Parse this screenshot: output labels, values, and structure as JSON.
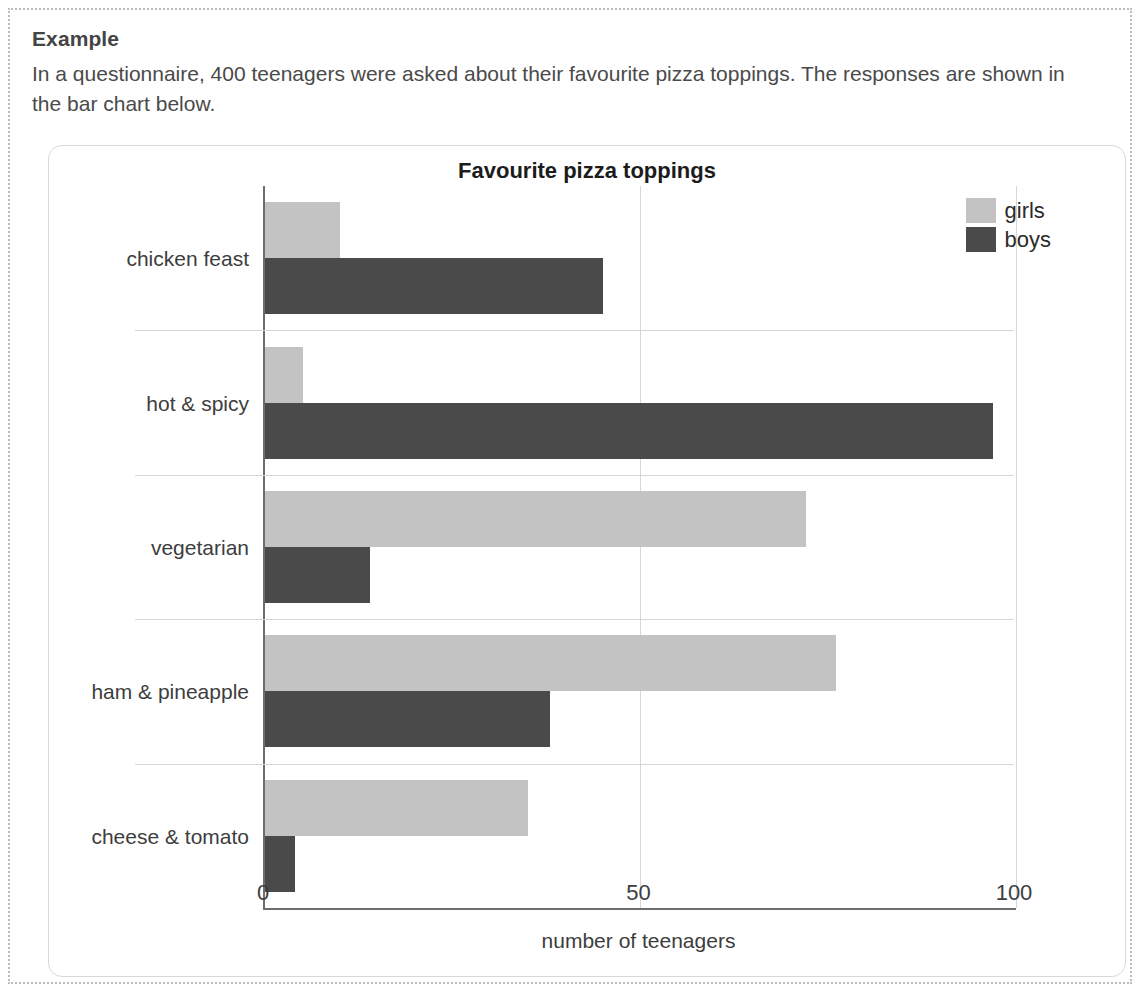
{
  "example": {
    "heading": "Example",
    "body": "In a questionnaire, 400 teenagers were asked about their favourite pizza toppings. The responses are shown in the bar chart below."
  },
  "chart_data": {
    "type": "bar",
    "orientation": "horizontal",
    "title": "Favourite pizza toppings",
    "xlabel": "number of teenagers",
    "ylabel": "",
    "xlim": [
      0,
      100
    ],
    "xticks": [
      0,
      50,
      100
    ],
    "xtick_labels": [
      "0",
      "50",
      "100"
    ],
    "grid": true,
    "legend_position": "top-right",
    "categories": [
      "chicken feast",
      "hot & spicy",
      "vegetarian",
      "ham & pineapple",
      "cheese & tomato"
    ],
    "series": [
      {
        "name": "girls",
        "color": "#c3c3c3",
        "values": [
          10,
          5,
          72,
          76,
          35
        ]
      },
      {
        "name": "boys",
        "color": "#4a4a4a",
        "values": [
          45,
          97,
          14,
          38,
          4
        ]
      }
    ]
  },
  "colors": {
    "girls": "#c3c3c3",
    "boys": "#4a4a4a",
    "axis": "#6d6d6d",
    "grid": "#d6d6d6",
    "card_border": "#d8d8d8",
    "frame_border": "#bdbdbd"
  }
}
